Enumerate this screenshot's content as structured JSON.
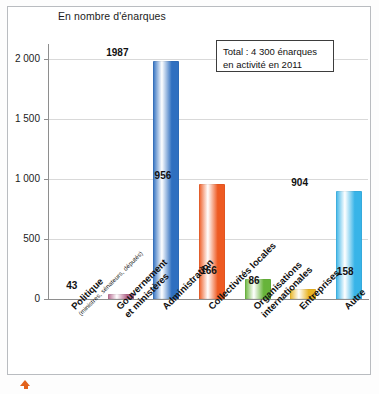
{
  "chart_data": {
    "type": "bar",
    "title": "En nombre d'énarques",
    "xlabel": "",
    "ylabel": "",
    "ylim": [
      0,
      2100
    ],
    "yticks": [
      0,
      500,
      1000,
      1500,
      2000
    ],
    "ytick_labels": [
      "0",
      "500",
      "1 000",
      "1 500",
      "2 000"
    ],
    "grid": true,
    "legend": "none",
    "categories": [
      "Politique",
      "Gouvernement et ministères",
      "Administration",
      "Collectivités locales",
      "Organisations internationales",
      "Entreprises",
      "Autre"
    ],
    "category_sublabels": [
      "(ministres, sénateurs, députés)",
      "",
      "",
      "",
      "",
      "",
      ""
    ],
    "values": [
      43,
      1987,
      956,
      166,
      86,
      904,
      158
    ],
    "value_labels": [
      "43",
      "1987",
      "956",
      "166",
      "86",
      "904",
      "158"
    ],
    "bar_colors": [
      "#b5688e",
      "#2f6fc0",
      "#ee5a22",
      "#67b43a",
      "#e9b423",
      "#38b4e8",
      "#f39019"
    ],
    "annotations": [
      {
        "line1": "Total : 4 300 énarques",
        "line2": "en activité en 2011"
      }
    ]
  },
  "figure": {
    "frame_color": "#b9bcc0",
    "axis_color": "#8e8e8e",
    "grid_color": "#d9d9d9",
    "background": "#ffffff",
    "marker_color": "#e2621b"
  }
}
